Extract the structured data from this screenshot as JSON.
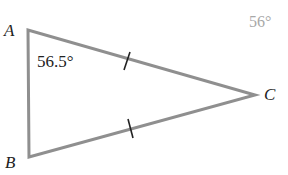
{
  "diagram": {
    "type": "isosceles triangle",
    "vertices": {
      "A": {
        "label": "A",
        "x": 28,
        "y": 30
      },
      "B": {
        "label": "B",
        "x": 29,
        "y": 157
      },
      "C": {
        "label": "C",
        "x": 255,
        "y": 95
      }
    },
    "angle_label": "56.5°",
    "side_label_faded": "56°",
    "congruent_sides": [
      "AC",
      "BC"
    ],
    "colors": {
      "stroke": "#8f8f8f",
      "text": "#222222",
      "faded_text": "#a8a8a8"
    }
  }
}
